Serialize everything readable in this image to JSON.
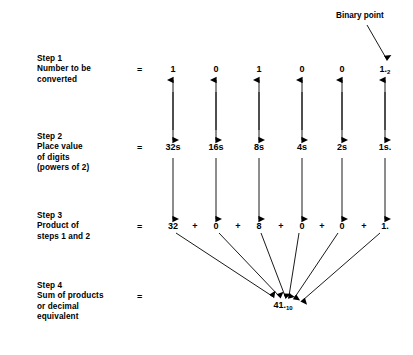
{
  "figure": {
    "annotation": {
      "binary_point_label": "Binary point"
    },
    "equals_sign": "=",
    "plus_sign": "+"
  },
  "steps": [
    {
      "id": "step1",
      "label": "Step 1\nNumber to be\nconverted",
      "equals": "="
    },
    {
      "id": "step2",
      "label": "Step 2\nPlace value\nof digits\n(powers of 2)",
      "equals": "="
    },
    {
      "id": "step3",
      "label": "Step 3\nProduct of\nsteps 1 and 2",
      "equals": "="
    },
    {
      "id": "step4",
      "label": "Step 4\nSum of products\nor decimal\nequivalent",
      "equals": "="
    }
  ],
  "columns": [
    {
      "x": 173,
      "digit": "1",
      "digit_sub": "",
      "place_value": "32s",
      "product": "32",
      "product_sub": ""
    },
    {
      "x": 216,
      "digit": "0",
      "digit_sub": "",
      "place_value": "16s",
      "product": "0",
      "product_sub": ""
    },
    {
      "x": 259,
      "digit": "1",
      "digit_sub": "",
      "place_value": "8s",
      "product": "8",
      "product_sub": ""
    },
    {
      "x": 302,
      "digit": "0",
      "digit_sub": "",
      "place_value": "4s",
      "product": "0",
      "product_sub": ""
    },
    {
      "x": 342,
      "digit": "0",
      "digit_sub": "",
      "place_value": "2s",
      "product": "0",
      "product_sub": ""
    },
    {
      "x": 385,
      "digit": "1.",
      "digit_sub": "2",
      "place_value": "1s.",
      "product": "1.",
      "product_sub": ""
    }
  ],
  "plus_positions": [
    195,
    238,
    281,
    322,
    364
  ],
  "result": {
    "value": "41.",
    "subscript": "10"
  },
  "chart_data": {
    "type": "diagram",
    "binary_number": "101001.",
    "binary_base": 2,
    "digits": [
      1,
      0,
      1,
      0,
      0,
      1
    ],
    "place_values": [
      32,
      16,
      8,
      4,
      2,
      1
    ],
    "products": [
      32,
      0,
      8,
      0,
      0,
      1
    ],
    "sum": 41,
    "decimal_base": 10
  },
  "colors": {
    "ink": "#000000",
    "background": "#ffffff"
  }
}
